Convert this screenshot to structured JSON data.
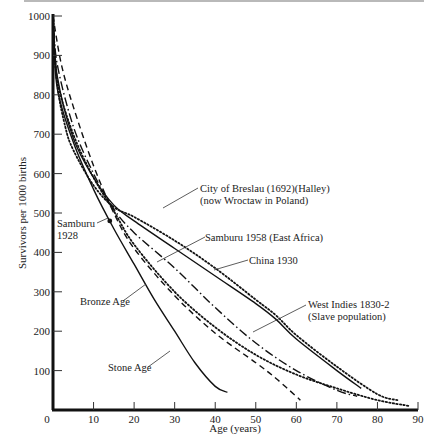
{
  "chart_data": {
    "type": "line",
    "title": "",
    "xlabel": "Age (years)",
    "ylabel": "Survivors per 1000 births",
    "xlim": [
      0,
      90
    ],
    "ylim": [
      0,
      1000
    ],
    "xticks": [
      0,
      10,
      20,
      30,
      40,
      50,
      60,
      70,
      80,
      90
    ],
    "yticks": [
      100,
      200,
      300,
      400,
      500,
      600,
      700,
      800,
      900,
      1000
    ],
    "grid": false,
    "legend": "none (inline annotations with leader lines)",
    "series": [
      {
        "name": "City of Breslau (1692)(Halley) (now Wroctaw in Poland)",
        "style": "dotted",
        "x": [
          0,
          1,
          3,
          5,
          10,
          15,
          20,
          30,
          40,
          50,
          55,
          60,
          70,
          80,
          85
        ],
        "values": [
          1000,
          830,
          720,
          660,
          570,
          515,
          490,
          430,
          360,
          280,
          240,
          190,
          110,
          40,
          25
        ]
      },
      {
        "name": "China 1930",
        "style": "solid",
        "x": [
          0,
          1,
          5,
          10,
          15,
          20,
          30,
          40,
          50,
          55,
          60,
          70,
          76
        ],
        "values": [
          1000,
          850,
          690,
          590,
          520,
          480,
          410,
          340,
          270,
          230,
          180,
          100,
          55
        ]
      },
      {
        "name": "West Indies 1830-2 (Slave population)",
        "style": "dashdot",
        "x": [
          0,
          1,
          5,
          10,
          15,
          20,
          30,
          40,
          50,
          60,
          70,
          75
        ],
        "values": [
          1000,
          880,
          720,
          600,
          510,
          450,
          360,
          260,
          170,
          100,
          50,
          35
        ]
      },
      {
        "name": "Samburu 1958 (East Africa)",
        "style": "dotted",
        "x": [
          0,
          1,
          5,
          10,
          15,
          20,
          30,
          40,
          50,
          60,
          70,
          80,
          88
        ],
        "values": [
          1000,
          840,
          700,
          590,
          505,
          420,
          300,
          210,
          140,
          90,
          55,
          25,
          10
        ]
      },
      {
        "name": "Bronze Age",
        "style": "dashed",
        "x": [
          0,
          2,
          5,
          10,
          15,
          20,
          30,
          40,
          50,
          55,
          61
        ],
        "values": [
          1000,
          880,
          770,
          620,
          500,
          410,
          290,
          195,
          120,
          80,
          25
        ]
      },
      {
        "name": "Stone Age",
        "style": "solid",
        "x": [
          0,
          1,
          5,
          10,
          15,
          20,
          25,
          30,
          35,
          40,
          43
        ],
        "values": [
          1000,
          820,
          680,
          560,
          460,
          370,
          280,
          200,
          120,
          60,
          45
        ]
      },
      {
        "name": "Samburu 1928",
        "style": "point",
        "x": [
          14
        ],
        "values": [
          480
        ]
      }
    ],
    "annotations": [
      {
        "lines": [
          "City of Breslau (1692)(Halley)",
          "(now Wroctaw in Poland)"
        ],
        "x": 200,
        "y": 192
      },
      {
        "lines": [
          "Samburu 1958 (East Africa)"
        ],
        "x": 205,
        "y": 241
      },
      {
        "lines": [
          "China 1930"
        ],
        "x": 249,
        "y": 264
      },
      {
        "lines": [
          "West Indies 1830-2",
          "(Slave population)"
        ],
        "x": 308,
        "y": 308
      },
      {
        "lines": [
          "Samburu",
          "1928"
        ],
        "x": 57,
        "y": 227
      },
      {
        "lines": [
          "Bronze Age"
        ],
        "x": 80,
        "y": 305
      },
      {
        "lines": [
          "Stone Age"
        ],
        "x": 108,
        "y": 371
      }
    ]
  }
}
